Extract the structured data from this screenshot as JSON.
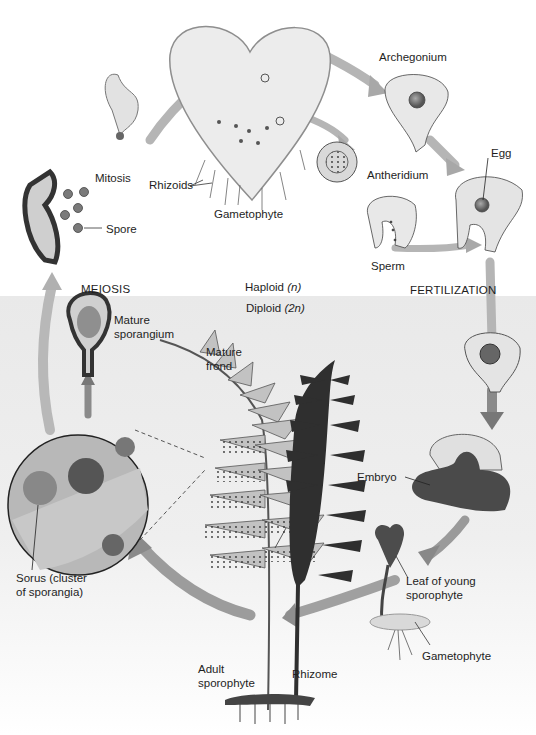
{
  "zones": {
    "haploid": {
      "label": "Haploid",
      "ploidy": "(n)"
    },
    "diploid": {
      "label": "Diploid",
      "ploidy": "(2n)"
    }
  },
  "processes": {
    "meiosis": "MEIOSIS",
    "fertilization": "FERTILIZATION",
    "mitosis": "Mitosis"
  },
  "labels": {
    "spore": "Spore",
    "rhizoids": "Rhizoids",
    "gametophyte": "Gametophyte",
    "archegonium": "Archegonium",
    "antheridium": "Antheridium",
    "egg": "Egg",
    "sperm": "Sperm",
    "mature_sporangium_1": "Mature",
    "mature_sporangium_2": "sporangium",
    "mature_frond_1": "Mature",
    "mature_frond_2": "frond",
    "embryo": "Embryo",
    "sorus_1": "Sorus (cluster",
    "sorus_2": "of sporangia)",
    "leaf_young_1": "Leaf of young",
    "leaf_young_2": "sporophyte",
    "gametophyte_young": "Gametophyte",
    "adult_1": "Adult",
    "adult_2": "sporophyte",
    "rhizome": "Rhizome"
  },
  "colors": {
    "haploid_bg": "#ffffff",
    "diploid_bg": "#ececec",
    "arrow": "#9a9a9a",
    "cell_fill": "#e4e4e4",
    "cell_stroke": "#555555",
    "dark_frond": "#2e2e2e",
    "light_frond": "#bdbdbd"
  }
}
